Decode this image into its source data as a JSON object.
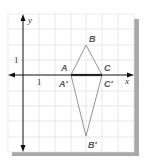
{
  "diagram": {
    "type": "coordinate-plane-reflection",
    "axes": {
      "x_label": "x",
      "y_label": "y",
      "x_tick_label": "1",
      "y_tick_label": "1"
    },
    "points": {
      "A": {
        "label": "A",
        "coords": [
          3,
          0
        ]
      },
      "B": {
        "label": "B",
        "coords": [
          4,
          2
        ]
      },
      "C": {
        "label": "C",
        "coords": [
          5,
          0
        ]
      },
      "A_prime": {
        "label": "A′",
        "coords": [
          3,
          0
        ]
      },
      "B_prime": {
        "label": "B′",
        "coords": [
          4,
          -4
        ]
      },
      "C_prime": {
        "label": "C′",
        "coords": [
          5,
          0
        ]
      }
    },
    "colors": {
      "grid": "#d8d8d8",
      "axes": "#111111",
      "triangle": "#777777",
      "shadow": "#a8a8a8",
      "labels": "#555555"
    }
  }
}
